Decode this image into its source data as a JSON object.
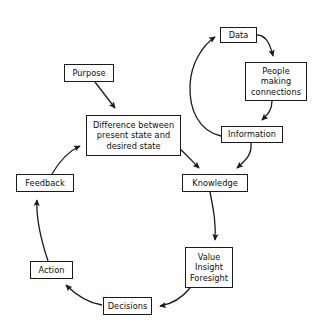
{
  "diagram": {
    "background_color": "#fefefe",
    "stroke_color": "#1a1a1a",
    "text_color": "#0d0d0d",
    "nodes": [
      {
        "id": "data",
        "lines": [
          "Data"
        ]
      },
      {
        "id": "people",
        "lines": [
          "People",
          "making",
          "connections"
        ]
      },
      {
        "id": "information",
        "lines": [
          "Information"
        ]
      },
      {
        "id": "purpose",
        "lines": [
          "Purpose"
        ]
      },
      {
        "id": "difference",
        "lines": [
          "Difference between",
          "present state and",
          "desired state"
        ]
      },
      {
        "id": "knowledge",
        "lines": [
          "Knowledge"
        ]
      },
      {
        "id": "value",
        "lines": [
          "Value",
          "Insight",
          "Foresight"
        ]
      },
      {
        "id": "decisions",
        "lines": [
          "Decisions"
        ]
      },
      {
        "id": "action",
        "lines": [
          "Action"
        ]
      },
      {
        "id": "feedback",
        "lines": [
          "Feedback"
        ]
      }
    ],
    "edges": [
      {
        "id": "data-to-people",
        "from": "data",
        "to": "people"
      },
      {
        "id": "people-to-information",
        "from": "people",
        "to": "information"
      },
      {
        "id": "information-to-data",
        "from": "information",
        "to": "data"
      },
      {
        "id": "information-to-knowledge",
        "from": "information",
        "to": "knowledge"
      },
      {
        "id": "purpose-to-difference",
        "from": "purpose",
        "to": "difference"
      },
      {
        "id": "difference-to-knowledge",
        "from": "difference",
        "to": "knowledge"
      },
      {
        "id": "knowledge-to-value",
        "from": "knowledge",
        "to": "value"
      },
      {
        "id": "value-to-decisions",
        "from": "value",
        "to": "decisions"
      },
      {
        "id": "decisions-to-action",
        "from": "decisions",
        "to": "action"
      },
      {
        "id": "action-to-feedback",
        "from": "action",
        "to": "feedback"
      },
      {
        "id": "feedback-to-difference",
        "from": "feedback",
        "to": "difference"
      }
    ]
  }
}
